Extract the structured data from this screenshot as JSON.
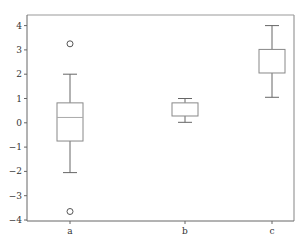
{
  "chart_data": {
    "type": "boxplot",
    "title": "",
    "xlabel": "",
    "ylabel": "",
    "categories": [
      "a",
      "b",
      "c"
    ],
    "ylim": [
      -4,
      4
    ],
    "yticks": [
      -4,
      -3,
      -2,
      -1,
      0,
      1,
      2,
      3,
      4
    ],
    "grid": false,
    "legend": null,
    "series": [
      {
        "name": "a",
        "whisker_low": -2.05,
        "q1": -0.75,
        "median": 0.22,
        "q3": 0.82,
        "whisker_high": 2.0,
        "outliers": [
          3.25,
          -3.65
        ]
      },
      {
        "name": "b",
        "whisker_low": 0.02,
        "q1": 0.28,
        "median": null,
        "q3": 0.82,
        "whisker_high": 1.0,
        "outliers": []
      },
      {
        "name": "c",
        "whisker_low": 1.05,
        "q1": 2.05,
        "median": null,
        "q3": 3.02,
        "whisker_high": 4.0,
        "outliers": []
      }
    ]
  },
  "colors": {
    "box": "#888888",
    "whisker": "#666666",
    "median": "#aaaaaa",
    "axis": "#666666",
    "frame": "#999999",
    "outlier": "#555555"
  },
  "caption": {
    "text": ""
  }
}
